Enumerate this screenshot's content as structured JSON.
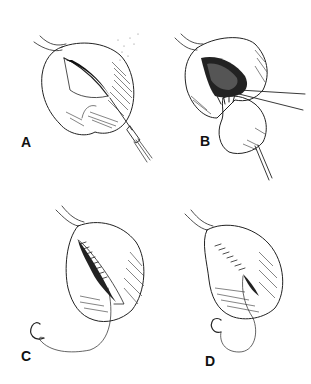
{
  "figure": {
    "ink_color": "#222222",
    "background": "#ffffff",
    "panels": [
      {
        "id": "A",
        "label": "A",
        "content": "Organ with incision being made by scalpel"
      },
      {
        "id": "B",
        "label": "B",
        "content": "Mass being extracted from opened organ with forceps and probe"
      },
      {
        "id": "C",
        "label": "C",
        "content": "Incision being closed with running suture, needle and thread"
      },
      {
        "id": "D",
        "label": "D",
        "content": "Suture line nearly complete, needle and thread"
      }
    ]
  }
}
